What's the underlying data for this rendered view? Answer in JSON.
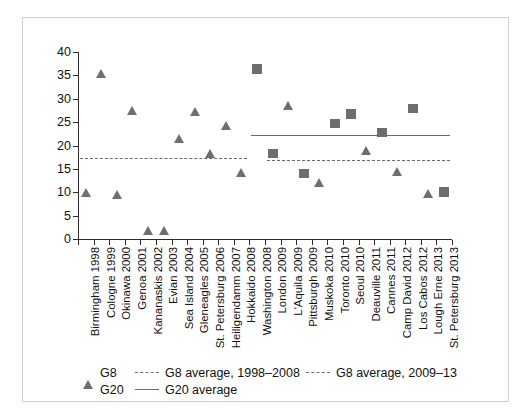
{
  "chart_data": {
    "type": "scatter",
    "title": "",
    "xlabel": "",
    "ylabel": "",
    "ylim": [
      0,
      40
    ],
    "yticks": [
      0,
      5,
      10,
      15,
      20,
      25,
      30,
      35,
      40
    ],
    "grid": false,
    "legend_position": "bottom-left",
    "categories": [
      "Birmingham 1998",
      "Cologne 1999",
      "Okinawa 2000",
      "Genoa 2001",
      "Kananaskis 2002",
      "Evian 2003",
      "Sea Island 2004",
      "Gleneagles 2005",
      "St. Petersburg 2006",
      "Heiligendamm 2007",
      "Hokkaido 2008",
      "Washington 2008",
      "London 2009",
      "L'Aquila 2009",
      "Pittsburgh 2009",
      "Muskoka 2010",
      "Toronto 2010",
      "Seoul 2010",
      "Deauville 2011",
      "Cannes 2011",
      "Camp David 2012",
      "Los Cabos 2012",
      "Lough Erne 2013",
      "St. Petersburg 2013"
    ],
    "series": [
      {
        "name": "G8",
        "marker": "triangle",
        "color": "#6e6e6e",
        "points": [
          {
            "category": "Birmingham 1998",
            "value": 10.0
          },
          {
            "category": "Cologne 1999",
            "value": 35.3
          },
          {
            "category": "Okinawa 2000",
            "value": 9.4
          },
          {
            "category": "Genoa 2001",
            "value": 27.5
          },
          {
            "category": "Kananaskis 2002",
            "value": 1.8
          },
          {
            "category": "Evian 2003",
            "value": 1.7
          },
          {
            "category": "Sea Island 2004",
            "value": 21.5
          },
          {
            "category": "Gleneagles 2005",
            "value": 27.2
          },
          {
            "category": "St. Petersburg 2006",
            "value": 18.3
          },
          {
            "category": "Heiligendamm 2007",
            "value": 24.2
          },
          {
            "category": "Hokkaido 2008",
            "value": 14.2
          },
          {
            "category": "L'Aquila 2009",
            "value": 28.5
          },
          {
            "category": "Pittsburgh 2009",
            "value": 14.0
          },
          {
            "category": "Muskoka 2010",
            "value": 12.0
          },
          {
            "category": "Deauville 2011",
            "value": 18.8
          },
          {
            "category": "Camp David 2012",
            "value": 14.5
          },
          {
            "category": "Lough Erne 2013",
            "value": 9.7
          }
        ]
      },
      {
        "name": "G20",
        "marker": "square",
        "color": "#6e6e6e",
        "points": [
          {
            "category": "Washington 2008",
            "value": 36.3
          },
          {
            "category": "London 2009",
            "value": 18.3
          },
          {
            "category": "Pittsburgh 2009",
            "value": 14.0
          },
          {
            "category": "Toronto 2010",
            "value": 24.7
          },
          {
            "category": "Seoul 2010",
            "value": 26.8
          },
          {
            "category": "Cannes 2011",
            "value": 22.8
          },
          {
            "category": "Los Cabos 2012",
            "value": 27.9
          },
          {
            "category": "St. Petersburg 2013",
            "value": 10.0
          }
        ]
      }
    ],
    "reference_lines": [
      {
        "name": "G8 average, 1998–2008",
        "value": 17.3,
        "style": "dashed",
        "color": "#6b6b6b",
        "from_category": "Birmingham 1998",
        "to_category": "Hokkaido 2008"
      },
      {
        "name": "G8 average, 2009–13",
        "value": 17.0,
        "style": "dashed",
        "color": "#6b6b6b",
        "from_category": "London 2009",
        "to_category": "St. Petersburg 2013"
      },
      {
        "name": "G20 average",
        "value": 22.3,
        "style": "solid",
        "color": "#6b6b6b",
        "from_category": "Washington 2008",
        "to_category": "St. Petersburg 2013"
      }
    ]
  },
  "legend": {
    "items": [
      {
        "label": "G8",
        "symbol": "triangle-marker"
      },
      {
        "label": "G8 average, 1998–2008",
        "symbol": "dashed-line"
      },
      {
        "label": "G8 average, 2009–13",
        "symbol": "dashed-line"
      },
      {
        "label": "G20",
        "symbol": "square-marker"
      },
      {
        "label": "G20 average",
        "symbol": "solid-line"
      }
    ]
  }
}
